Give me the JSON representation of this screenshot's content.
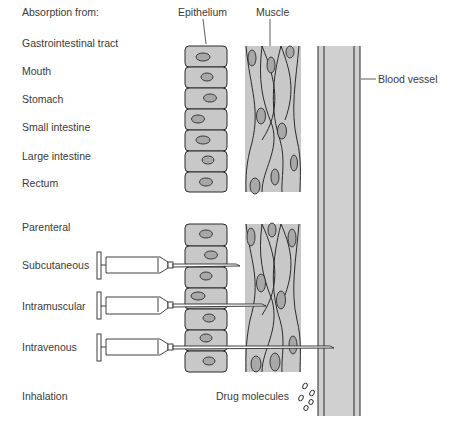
{
  "title": "Absorption from:",
  "headers": {
    "epithelium": "Epithelium",
    "muscle": "Muscle",
    "blood_vessel": "Blood vessel"
  },
  "routes": [
    {
      "label": "Gastrointestinal tract",
      "y": 19
    },
    {
      "label": "Mouth",
      "y": 47
    },
    {
      "label": "Stomach",
      "y": 74
    },
    {
      "label": "Small intestine",
      "y": 102
    },
    {
      "label": "Large intestine",
      "y": 131
    },
    {
      "label": "Rectum",
      "y": 157
    },
    {
      "label": "Parenteral",
      "y": 221
    },
    {
      "label": "Subcutaneous",
      "y": 262
    },
    {
      "label": "Intramuscular",
      "y": 302
    },
    {
      "label": "Intravenous",
      "y": 344
    },
    {
      "label": "Inhalation",
      "y": 392
    }
  ],
  "drug_molecules_label": "Drug molecules",
  "colors": {
    "tissue_fill": "#c8c8c8",
    "nucleus_fill": "#a8a8a8",
    "vessel_fill": "#d0d0d0",
    "stroke": "#2a2a2a"
  }
}
